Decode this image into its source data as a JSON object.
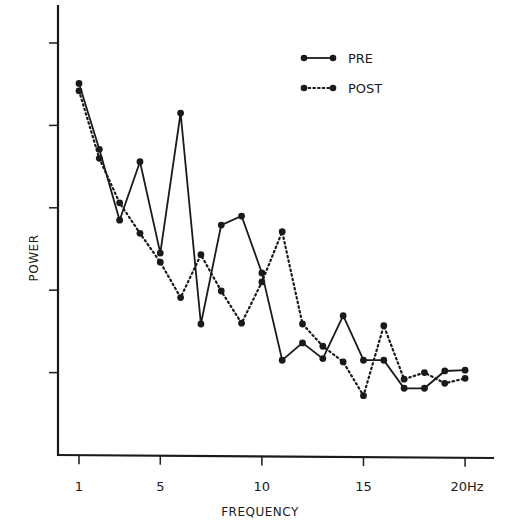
{
  "chart_data": {
    "type": "line",
    "title": "",
    "xlabel": "FREQUENCY",
    "ylabel": "POWER",
    "x": [
      1,
      2,
      3,
      4,
      5,
      6,
      7,
      8,
      9,
      10,
      11,
      12,
      13,
      14,
      15,
      16,
      17,
      18,
      19,
      20
    ],
    "x_ticks": [
      1,
      5,
      10,
      15,
      20
    ],
    "x_tick_labels": [
      "1",
      "5",
      "10",
      "15",
      "20Hz"
    ],
    "y_ticks_count": 5,
    "y_tick_labels": [],
    "xlim": [
      0,
      21.5
    ],
    "ylim": [
      0,
      5.4
    ],
    "grid": false,
    "legend_position": "upper right",
    "series": [
      {
        "name": "PRE",
        "style": "solid",
        "values": [
          4.51,
          3.71,
          2.85,
          3.56,
          2.45,
          4.15,
          1.59,
          2.79,
          2.9,
          2.21,
          1.15,
          1.36,
          1.17,
          1.69,
          1.15,
          1.15,
          0.81,
          0.81,
          1.02,
          1.03
        ]
      },
      {
        "name": "POST",
        "style": "dotted",
        "values": [
          4.42,
          3.6,
          3.06,
          2.69,
          2.34,
          1.91,
          2.43,
          1.99,
          1.6,
          2.1,
          2.71,
          1.59,
          1.32,
          1.13,
          0.72,
          1.57,
          0.92,
          1.0,
          0.87,
          0.93
        ]
      }
    ]
  },
  "legend": {
    "pre_label": "PRE",
    "post_label": "POST"
  },
  "axes": {
    "x_title": "FREQUENCY",
    "y_title": "POWER",
    "x_tick_labels": [
      "1",
      "5",
      "10",
      "15",
      "20Hz"
    ]
  },
  "colors": {
    "ink": "#1a1a1a",
    "background": "#ffffff"
  }
}
